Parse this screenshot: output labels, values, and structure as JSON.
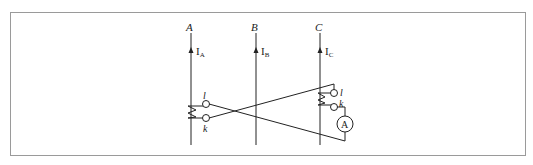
{
  "diagram": {
    "type": "circuit",
    "phases": [
      {
        "name": "A",
        "current_label": "I",
        "current_sub": "A"
      },
      {
        "name": "B",
        "current_label": "I",
        "current_sub": "B"
      },
      {
        "name": "C",
        "current_label": "I",
        "current_sub": "C"
      }
    ],
    "ct_A": {
      "terminal_top": "l",
      "terminal_bottom": "k"
    },
    "ct_C": {
      "terminal_top": "l",
      "terminal_bottom": "k"
    },
    "meter": {
      "symbol": "A"
    },
    "colors": {
      "line": "#222222",
      "frame": "#9a9a9a"
    }
  }
}
